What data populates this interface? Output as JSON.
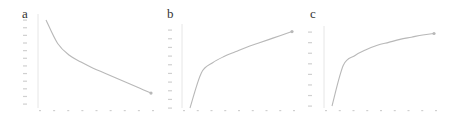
{
  "figure": {
    "panels": [
      {
        "label": "a"
      },
      {
        "label": "b"
      },
      {
        "label": "c"
      }
    ],
    "colors": {
      "line": "#b8b8b8",
      "axis": "#e6e6e6",
      "tick": "#d0d0d0",
      "label": "#333333"
    }
  },
  "chart_data": [
    {
      "type": "line",
      "panel": "a",
      "title": "",
      "xlabel": "",
      "ylabel": "",
      "x": [
        1,
        2,
        3,
        4,
        5,
        6,
        7,
        8,
        9,
        10
      ],
      "series": [
        {
          "name": "a",
          "values": [
            1.0,
            0.72,
            0.58,
            0.5,
            0.43,
            0.37,
            0.31,
            0.25,
            0.19,
            0.13
          ]
        }
      ],
      "x_ticks": 9,
      "y_ticks": 12,
      "grid": false,
      "note": "Monotonically decreasing convex curve; tick labels illegible in source; values normalized 0-1"
    },
    {
      "type": "line",
      "panel": "b",
      "title": "",
      "xlabel": "",
      "ylabel": "",
      "x": [
        1,
        2,
        3,
        4,
        5,
        6,
        7,
        8,
        9,
        10
      ],
      "series": [
        {
          "name": "b",
          "values": [
            0.0,
            0.45,
            0.58,
            0.66,
            0.72,
            0.78,
            0.83,
            0.88,
            0.93,
            0.98
          ]
        }
      ],
      "x_ticks": 9,
      "y_ticks": 10,
      "grid": false,
      "note": "Monotonically increasing concave curve with end marker; tick labels illegible; values normalized 0-1"
    },
    {
      "type": "line",
      "panel": "c",
      "title": "",
      "xlabel": "",
      "ylabel": "",
      "x": [
        1,
        2,
        3,
        4,
        5,
        6,
        7,
        8,
        9,
        10
      ],
      "series": [
        {
          "name": "c",
          "values": [
            0.0,
            0.55,
            0.68,
            0.76,
            0.82,
            0.86,
            0.9,
            0.93,
            0.96,
            0.98
          ]
        }
      ],
      "x_ticks": 9,
      "y_ticks": 8,
      "grid": false,
      "note": "Monotonically increasing concave curve saturating; end marker; tick labels illegible; values normalized 0-1"
    }
  ]
}
